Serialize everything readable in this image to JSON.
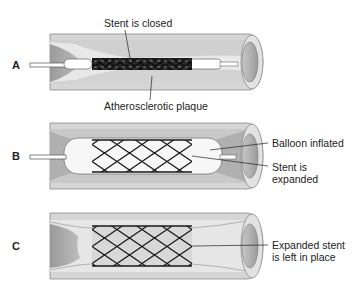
{
  "figure": {
    "panels": [
      {
        "id": "A",
        "letter": "A",
        "labels": {
          "top": "Stent is closed",
          "bottom": "Atherosclerotic plaque"
        }
      },
      {
        "id": "B",
        "letter": "B",
        "labels": {
          "balloon": "Balloon inflated",
          "stent_line1": "Stent is",
          "stent_line2": "expanded"
        }
      },
      {
        "id": "C",
        "letter": "C",
        "labels": {
          "stent_line1": "Expanded stent",
          "stent_line2": "is left in place"
        }
      }
    ]
  },
  "colors": {
    "vessel_wall": "#d4d4d4",
    "vessel_outline": "#8a8a8a",
    "lumen": "#e9e9e9",
    "plaque": "#a8a8a8",
    "plaque_dark": "#8c8c8c",
    "balloon": "#f5f5f5",
    "stent": "#1a1a1a",
    "text": "#222222"
  }
}
